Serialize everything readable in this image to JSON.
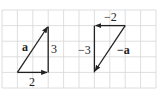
{
  "figure": {
    "grid": {
      "x_lines": [
        2,
        17.4,
        32.8,
        48.2,
        63.6,
        79,
        94.4,
        109.8,
        125.2,
        140.6,
        156
      ],
      "y_lines": [
        10,
        25.6,
        41.2,
        56.8,
        72.4,
        88
      ],
      "color": "#d6d6d6"
    },
    "stroke_color": "#222222",
    "vectors": [
      {
        "name": "a",
        "label": "a",
        "components": {
          "x": 2,
          "y": 3
        },
        "horizontal_label": "2",
        "vertical_label": "3"
      },
      {
        "name": "neg-a",
        "label": "−a",
        "components": {
          "x": -2,
          "y": -3
        },
        "horizontal_label": "−2",
        "vertical_label": "−3"
      }
    ]
  }
}
